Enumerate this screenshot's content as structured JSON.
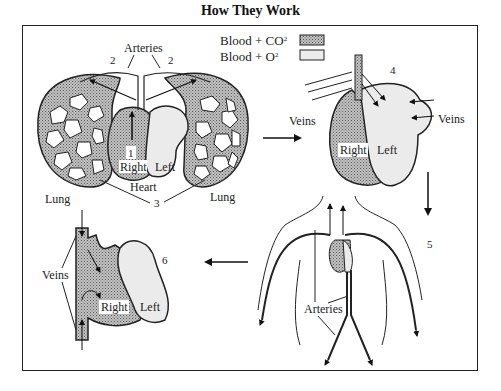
{
  "title": "How They Work",
  "legend": {
    "items": [
      {
        "label": "Blood + CO",
        "sup": "2",
        "pattern": "stippled-dark",
        "color": "#b0b0b0"
      },
      {
        "label": "Blood + O",
        "sup": "2",
        "pattern": "light",
        "color": "#ebebeb"
      }
    ]
  },
  "panels": {
    "lungs": {
      "arteries_label": "Arteries",
      "step_1": "1",
      "step_2_left": "2",
      "step_2_right": "2",
      "step_3": "3",
      "heart_label": "Heart",
      "lung_left": "Lung",
      "lung_right": "Lung",
      "right_label": "Right",
      "left_label": "Left"
    },
    "heart_return": {
      "step": "4",
      "veins_left": "Veins",
      "veins_right": "Veins",
      "right_label": "Right",
      "left_label": "Left"
    },
    "body": {
      "step": "5",
      "arteries_label": "Arteries"
    },
    "heart_body_return": {
      "step": "6",
      "veins_label": "Veins",
      "right_label": "Right",
      "left_label": "Left"
    }
  }
}
